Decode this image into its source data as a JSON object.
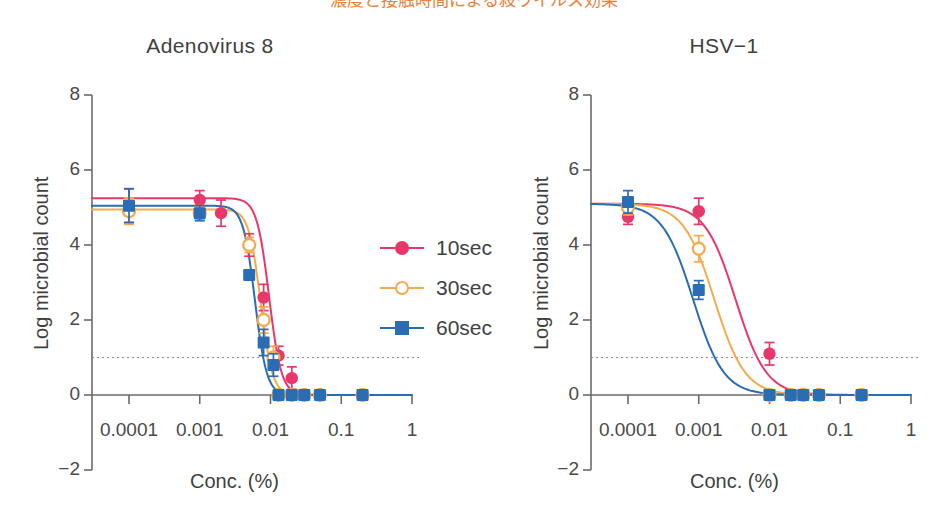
{
  "figure": {
    "top_cropped_caption": "濃度と接触時間による殺ウイルス効果",
    "background": "#ffffff",
    "width": 948,
    "height": 519
  },
  "colors": {
    "series_10sec": "#e8386b",
    "series_30sec": "#f5ab4d",
    "series_60sec": "#2a6db5",
    "axis": "#6b6b6b",
    "text": "#3f3f3f",
    "detection_line": "#8a8a8a"
  },
  "legend": {
    "position": "center-right-of-left-panel",
    "items": [
      {
        "label": "10sec",
        "color": "#e8386b",
        "marker": "filled-circle"
      },
      {
        "label": "30sec",
        "color": "#f5ab4d",
        "marker": "open-circle"
      },
      {
        "label": "60sec",
        "color": "#2a6db5",
        "marker": "filled-square"
      }
    ]
  },
  "axes_common": {
    "xlabel": "Conc. (%)",
    "ylabel": "Log microbial count",
    "x_tick_labels": [
      "0.0001",
      "0.001",
      "0.01",
      "0.1",
      "1"
    ],
    "x_tick_values": [
      0.0001,
      0.001,
      0.01,
      0.1,
      1
    ],
    "y_tick_labels": [
      "8",
      "6",
      "4",
      "2",
      "0",
      "−2"
    ],
    "y_tick_values": [
      8,
      6,
      4,
      2,
      0,
      -2
    ],
    "ylim": [
      -2,
      8
    ],
    "xlim_log10": [
      -4.5,
      0
    ],
    "xscale": "log",
    "grid": false,
    "detection_limit": 1
  },
  "chart_data": [
    {
      "type": "line",
      "panel": "left",
      "title": "Adenovirus 8",
      "xlabel": "Conc. (%)",
      "ylabel": "Log microbial count",
      "xscale": "log",
      "ylim": [
        -2,
        8
      ],
      "xlim": [
        3e-05,
        1
      ],
      "grid": false,
      "detection_limit_line": 1,
      "legend_position": "right",
      "series": [
        {
          "name": "10sec",
          "color": "#e8386b",
          "marker": "filled-circle",
          "x": [
            0.0001,
            0.001,
            0.002,
            0.005,
            0.008,
            0.013,
            0.02,
            0.03,
            0.05,
            0.2
          ],
          "values": [
            5.05,
            5.2,
            4.85,
            4.0,
            2.6,
            1.05,
            0.45,
            0.0,
            0.0,
            0.0
          ],
          "yerr": [
            0.45,
            0.25,
            0.35,
            0.3,
            0.35,
            0.25,
            0.3,
            0.0,
            0.0,
            0.0
          ]
        },
        {
          "name": "30sec",
          "color": "#f5ab4d",
          "marker": "open-circle",
          "x": [
            0.0001,
            0.001,
            0.005,
            0.008,
            0.011,
            0.013,
            0.02,
            0.03,
            0.05,
            0.2
          ],
          "values": [
            4.9,
            4.85,
            4.0,
            2.0,
            1.0,
            0.0,
            0.0,
            0.0,
            0.0,
            0.0
          ],
          "yerr": [
            0.35,
            0.2,
            0.2,
            0.35,
            0.3,
            0.0,
            0.0,
            0.0,
            0.0,
            0.0
          ]
        },
        {
          "name": "60sec",
          "color": "#2a6db5",
          "marker": "filled-square",
          "x": [
            0.0001,
            0.001,
            0.005,
            0.008,
            0.011,
            0.013,
            0.02,
            0.03,
            0.05,
            0.2
          ],
          "values": [
            5.05,
            4.85,
            3.2,
            1.4,
            0.8,
            0.0,
            0.0,
            0.0,
            0.0,
            0.0
          ],
          "yerr": [
            0.45,
            0.2,
            0.0,
            0.35,
            0.3,
            0.0,
            0.0,
            0.0,
            0.0,
            0.0
          ]
        }
      ],
      "fit_curves": [
        {
          "name": "10sec",
          "color": "#e8386b",
          "ec50_log10": -2.02,
          "top": 5.25,
          "bottom": 0.0,
          "hill": 5.0
        },
        {
          "name": "30sec",
          "color": "#f5ab4d",
          "ec50_log10": -2.14,
          "top": 4.95,
          "bottom": 0.0,
          "hill": 5.2
        },
        {
          "name": "60sec",
          "color": "#2a6db5",
          "ec50_log10": -2.22,
          "top": 5.05,
          "bottom": 0.0,
          "hill": 5.2
        }
      ]
    },
    {
      "type": "line",
      "panel": "right",
      "title": "HSV−1",
      "xlabel": "Conc. (%)",
      "ylabel": "Log microbial count",
      "xscale": "log",
      "ylim": [
        -2,
        8
      ],
      "xlim": [
        3e-05,
        1
      ],
      "grid": false,
      "detection_limit_line": 1,
      "legend_position": "none",
      "series": [
        {
          "name": "10sec",
          "color": "#e8386b",
          "marker": "filled-circle",
          "x": [
            0.0001,
            0.001,
            0.01,
            0.02,
            0.03,
            0.05,
            0.2
          ],
          "values": [
            4.75,
            4.9,
            1.1,
            0.0,
            0.0,
            0.0,
            0.0
          ],
          "yerr": [
            0.2,
            0.35,
            0.3,
            0.0,
            0.0,
            0.0,
            0.0
          ]
        },
        {
          "name": "30sec",
          "color": "#f5ab4d",
          "marker": "open-circle",
          "x": [
            0.0001,
            0.001,
            0.01,
            0.02,
            0.03,
            0.05,
            0.2
          ],
          "values": [
            5.0,
            3.9,
            0.0,
            0.0,
            0.0,
            0.0,
            0.0
          ],
          "yerr": [
            0.2,
            0.35,
            0.0,
            0.0,
            0.0,
            0.0,
            0.0
          ]
        },
        {
          "name": "60sec",
          "color": "#2a6db5",
          "marker": "filled-square",
          "x": [
            0.0001,
            0.001,
            0.01,
            0.02,
            0.03,
            0.05,
            0.2
          ],
          "values": [
            5.15,
            2.8,
            0.0,
            0.0,
            0.0,
            0.0,
            0.0
          ],
          "yerr": [
            0.3,
            0.25,
            0.0,
            0.0,
            0.0,
            0.0,
            0.0
          ]
        }
      ],
      "fit_curves": [
        {
          "name": "10sec",
          "color": "#e8386b",
          "ec50_log10": -2.48,
          "top": 5.1,
          "bottom": 0.0,
          "hill": 2.0
        },
        {
          "name": "30sec",
          "color": "#f5ab4d",
          "ec50_log10": -2.78,
          "top": 5.1,
          "bottom": 0.0,
          "hill": 2.0
        },
        {
          "name": "60sec",
          "color": "#2a6db5",
          "ec50_log10": -3.08,
          "top": 5.1,
          "bottom": 0.0,
          "hill": 2.0
        }
      ]
    }
  ]
}
